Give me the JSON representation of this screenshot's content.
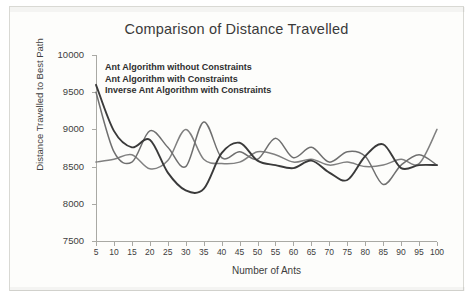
{
  "chart_data": {
    "type": "line",
    "title": "Comparison of Distance Travelled",
    "xlabel": "Number of Ants",
    "ylabel": "Distance Travelled to Best Path",
    "xlim": [
      5,
      100
    ],
    "ylim": [
      7500,
      10000
    ],
    "ytick_labels": [
      "10000",
      "9500",
      "9000",
      "8500",
      "8000",
      "7500"
    ],
    "ytick_values": [
      10000,
      9500,
      9000,
      8500,
      8000,
      7500
    ],
    "xtick_labels": [
      "5",
      "10",
      "15",
      "20",
      "25",
      "30",
      "35",
      "40",
      "45",
      "50",
      "55",
      "60",
      "65",
      "70",
      "75",
      "80",
      "85",
      "90",
      "95",
      "100"
    ],
    "x": [
      5,
      10,
      15,
      20,
      25,
      30,
      35,
      40,
      45,
      50,
      55,
      60,
      65,
      70,
      75,
      80,
      85,
      90,
      95,
      100
    ],
    "grid": false,
    "legend_position": "top-left-inside",
    "series": [
      {
        "name": "Ant Algorithm without Constraints",
        "color": "#808080",
        "values": [
          8560,
          8600,
          8660,
          8470,
          8580,
          9000,
          8600,
          8540,
          8560,
          8700,
          8660,
          8560,
          8600,
          8520,
          8560,
          8500,
          8520,
          8600,
          8540,
          9000
        ]
      },
      {
        "name": "Ant Algorithm with Constraints",
        "color": "#6f6f6f",
        "values": [
          9500,
          8700,
          8560,
          8980,
          8760,
          8500,
          9100,
          8620,
          8700,
          8600,
          8880,
          8620,
          8760,
          8560,
          8700,
          8640,
          8260,
          8520,
          8660,
          8520
        ]
      },
      {
        "name": "Inverse Ant Algorithm with Constraints",
        "color": "#3a3a3a",
        "values": [
          9600,
          8980,
          8760,
          8860,
          8420,
          8180,
          8200,
          8680,
          8820,
          8580,
          8520,
          8480,
          8580,
          8420,
          8320,
          8640,
          8800,
          8480,
          8520,
          8520
        ]
      }
    ],
    "legend_entries": [
      "Ant Algorithm without Constraints",
      "Ant Algorithm with Constraints",
      "Inverse Ant Algorithm with Constraints"
    ]
  }
}
